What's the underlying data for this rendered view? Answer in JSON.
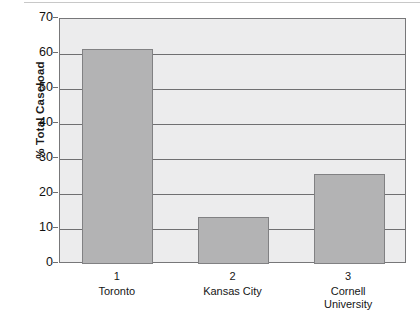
{
  "chart_data": {
    "type": "bar",
    "title": "",
    "xlabel": "",
    "ylabel": "% Total Caseload",
    "ylim": [
      0,
      70
    ],
    "yticks": [
      0,
      10,
      20,
      30,
      40,
      50,
      60,
      70
    ],
    "ytick_labels": [
      "0",
      "10",
      "20",
      "30",
      "40",
      "50",
      "60",
      "70"
    ],
    "grid": true,
    "legend": "none",
    "categories": [
      "Toronto",
      "Kansas City",
      "Cornell University"
    ],
    "category_numbers": [
      "1",
      "2",
      "3"
    ],
    "values": [
      61.5,
      13.5,
      25.7
    ],
    "bars": [
      {
        "number": "1",
        "name_line1": "Toronto",
        "name_line2": "",
        "value": 61.5
      },
      {
        "number": "2",
        "name_line1": "Kansas City",
        "name_line2": "",
        "value": 13.5
      },
      {
        "number": "3",
        "name_line1": "Cornell",
        "name_line2": "University",
        "value": 25.7
      }
    ],
    "colors": {
      "bar_fill": "#b3b3b4",
      "bar_edge": "#818183",
      "plot_background": "#ececed",
      "gridline": "#6f6f71",
      "axis": "#777779",
      "text": "#161616"
    }
  }
}
